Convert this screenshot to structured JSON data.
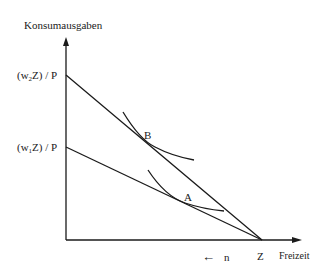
{
  "diagram": {
    "y_axis_label": "Konsumausgaben",
    "x_axis_label": "Freizeit",
    "y_intercept_upper": {
      "prefix": "(w",
      "sub": "2",
      "suffix": "Z) / P"
    },
    "y_intercept_lower": {
      "prefix": "(w",
      "sub": "1",
      "suffix": "Z) / P"
    },
    "x_intercept_label": "Z",
    "point_b_label": "B",
    "point_a_label": "A",
    "direction_arrow": "←",
    "direction_label": "n",
    "line_color": "#1a1a1a",
    "background_color": "#ffffff"
  }
}
